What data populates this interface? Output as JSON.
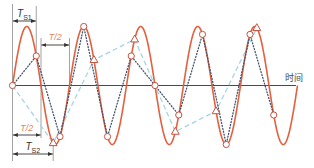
{
  "figure": {
    "colors": {
      "signal": "#E4603E",
      "ts1_line": "#44546E",
      "ts2_line": "#A6D5E6",
      "marker_stroke": "#C4533F",
      "marker_fill": "#FFFFFF",
      "axis": "#4A4A4A",
      "guide": "#8C8C8C",
      "dimension_arrow": "#333333",
      "dimension_text": "#333333",
      "half_period_text": "#E2875A"
    }
  },
  "chart_data": {
    "type": "line",
    "title": "",
    "xlabel": "时间",
    "ylabel": "",
    "x_range": [
      0,
      5
    ],
    "y_range": [
      -1,
      1
    ],
    "grid": false,
    "legend": null,
    "series": [
      {
        "id": "signal",
        "style": "solid",
        "function": "sin",
        "period": 1,
        "amplitude": 1,
        "x_range": [
          0,
          5
        ]
      },
      {
        "id": "samples_ts1",
        "label": "T_S1",
        "sampling_period": 0.417,
        "style": "dotted",
        "marker": "circle",
        "x": [
          0,
          0.417,
          0.833,
          1.25,
          1.667,
          2.083,
          2.5,
          2.917,
          3.333,
          3.75,
          4.167,
          4.583
        ],
        "y": [
          0,
          0.5,
          -0.866,
          1,
          -0.866,
          0.5,
          0,
          -0.5,
          0.866,
          -1,
          0.866,
          -0.5
        ]
      },
      {
        "id": "samples_ts2",
        "label": "T_S2",
        "sampling_period": 0.714,
        "style": "dashed",
        "marker": "triangle",
        "x": [
          0,
          0.714,
          1.429,
          2.143,
          2.857,
          3.571,
          4.286
        ],
        "y": [
          0,
          -0.975,
          0.434,
          0.782,
          -0.782,
          -0.434,
          0.975
        ]
      }
    ],
    "annotations": [
      {
        "id": "ts1",
        "label": "T_S1",
        "label_main": "T",
        "label_sub": "S1",
        "from": 0,
        "to": 0.417
      },
      {
        "id": "half_top",
        "label": "T/2",
        "from": 0.5,
        "to": 1.0
      },
      {
        "id": "half_bottom",
        "label": "T/2",
        "from": 0,
        "to": 0.5
      },
      {
        "id": "ts2",
        "label": "T_S2",
        "label_main": "T",
        "label_sub": "S2",
        "from": 0,
        "to": 0.714
      }
    ]
  }
}
